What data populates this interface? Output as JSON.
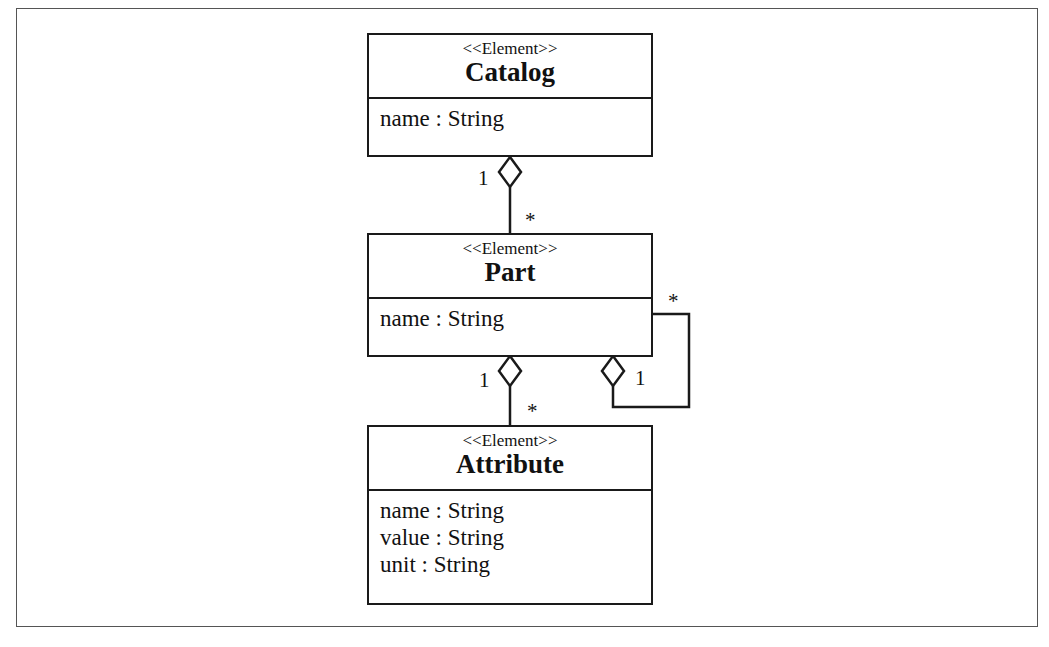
{
  "diagram": {
    "type": "UML class diagram",
    "classes": [
      {
        "id": "catalog",
        "stereotype": "<<Element>>",
        "name": "Catalog",
        "attributes": [
          "name : String"
        ]
      },
      {
        "id": "part",
        "stereotype": "<<Element>>",
        "name": "Part",
        "attributes": [
          "name : String"
        ]
      },
      {
        "id": "attribute",
        "stereotype": "<<Element>>",
        "name": "Attribute",
        "attributes": [
          "name : String",
          "value : String",
          "unit : String"
        ]
      }
    ],
    "associations": [
      {
        "id": "catalog-part",
        "kind": "aggregation",
        "whole": "Catalog",
        "part": "Part",
        "whole_multiplicity": "1",
        "part_multiplicity": "*"
      },
      {
        "id": "part-attribute",
        "kind": "aggregation",
        "whole": "Part",
        "part": "Attribute",
        "whole_multiplicity": "1",
        "part_multiplicity": "*"
      },
      {
        "id": "part-self",
        "kind": "aggregation",
        "whole": "Part",
        "part": "Part",
        "whole_multiplicity": "1",
        "part_multiplicity": "*"
      }
    ],
    "colors": {
      "line": "#1a1a1a",
      "frame": "#555555",
      "background": "#ffffff"
    }
  }
}
